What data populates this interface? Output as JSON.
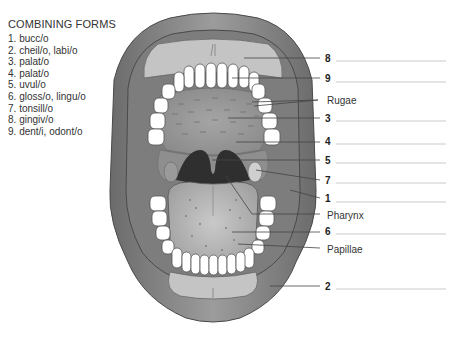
{
  "combining_forms": {
    "title": "COMBINING FORMS",
    "items": [
      {
        "n": "1.",
        "text": "bucc/o"
      },
      {
        "n": "2.",
        "text": "cheil/o, labi/o"
      },
      {
        "n": "3.",
        "text": "palat/o"
      },
      {
        "n": "4.",
        "text": "palat/o"
      },
      {
        "n": "5.",
        "text": "uvul/o"
      },
      {
        "n": "6.",
        "text": "gloss/o, lingu/o"
      },
      {
        "n": "7.",
        "text": "tonsill/o"
      },
      {
        "n": "8.",
        "text": "gingiv/o"
      },
      {
        "n": "9.",
        "text": "dent/i, odont/o"
      }
    ]
  },
  "labels": [
    {
      "id": "8",
      "text": "8",
      "type": "num",
      "y": 59
    },
    {
      "id": "9",
      "text": "9",
      "type": "num",
      "y": 79
    },
    {
      "id": "rugae",
      "text": "Rugae",
      "type": "word",
      "y": 101
    },
    {
      "id": "3",
      "text": "3",
      "type": "num",
      "y": 119
    },
    {
      "id": "4",
      "text": "4",
      "type": "num",
      "y": 142
    },
    {
      "id": "5",
      "text": "5",
      "type": "num",
      "y": 161
    },
    {
      "id": "7",
      "text": "7",
      "type": "num",
      "y": 181
    },
    {
      "id": "1",
      "text": "1",
      "type": "num",
      "y": 199
    },
    {
      "id": "pharynx",
      "text": "Pharynx",
      "type": "word",
      "y": 216
    },
    {
      "id": "6",
      "text": "6",
      "type": "num",
      "y": 232
    },
    {
      "id": "papillae",
      "text": "Papillae",
      "type": "word",
      "y": 250
    },
    {
      "id": "2",
      "text": "2",
      "type": "num",
      "y": 287
    }
  ],
  "colors": {
    "lip": "#8a8a8a",
    "lip_dark": "#5e5e5e",
    "gum": "#c4c4c4",
    "palate": "#9a9a9a",
    "cheek": "#7d7d7d",
    "throat": "#3a3a3a",
    "tongue": "#b5b5b5",
    "tooth": "#ffffff",
    "line": "#444444",
    "blank_line": "#bdbdbd"
  }
}
